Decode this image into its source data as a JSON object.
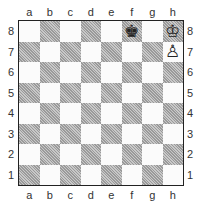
{
  "files": [
    "a",
    "b",
    "c",
    "d",
    "e",
    "f",
    "g",
    "h"
  ],
  "ranks": [
    "8",
    "7",
    "6",
    "5",
    "4",
    "3",
    "2",
    "1"
  ],
  "pieces": {
    "f8": {
      "glyph": "♚",
      "name": "black-king"
    },
    "h8": {
      "glyph": "♔",
      "name": "white-king"
    },
    "h7": {
      "glyph": "♙",
      "name": "white-pawn"
    }
  }
}
